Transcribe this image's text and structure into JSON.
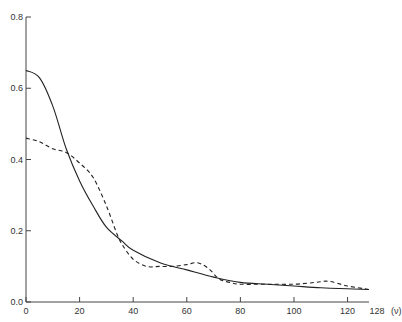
{
  "chart_data": {
    "type": "line",
    "title": "",
    "xlabel": "(ν)",
    "ylabel": "",
    "xlim": [
      0,
      128
    ],
    "ylim": [
      0,
      0.8
    ],
    "grid": false,
    "legend": null,
    "x_ticks": [
      0,
      20,
      40,
      60,
      80,
      100,
      120,
      128
    ],
    "x_tick_labels": [
      "0",
      "20",
      "40",
      "60",
      "80",
      "100",
      "120",
      "128"
    ],
    "x_unit_label": "(ν)",
    "y_ticks": [
      0.0,
      0.2,
      0.4,
      0.6,
      0.8
    ],
    "y_tick_labels": [
      "0.0",
      "0.2",
      "0.4",
      "0.6",
      "0.8"
    ],
    "series": [
      {
        "name": "solid",
        "style": "solid",
        "x": [
          0,
          5,
          10,
          15,
          20,
          25,
          30,
          36,
          40,
          50,
          60,
          70,
          80,
          90,
          100,
          110,
          120,
          128
        ],
        "values": [
          0.65,
          0.63,
          0.55,
          0.43,
          0.34,
          0.27,
          0.21,
          0.17,
          0.145,
          0.11,
          0.09,
          0.07,
          0.055,
          0.05,
          0.045,
          0.04,
          0.037,
          0.035
        ]
      },
      {
        "name": "dashed",
        "style": "dashed",
        "x": [
          0,
          5,
          10,
          15,
          20,
          25,
          30,
          34,
          36,
          40,
          45,
          50,
          55,
          60,
          64,
          68,
          72,
          76,
          80,
          90,
          100,
          108,
          113,
          120,
          128
        ],
        "values": [
          0.46,
          0.45,
          0.43,
          0.42,
          0.39,
          0.35,
          0.27,
          0.19,
          0.16,
          0.12,
          0.1,
          0.1,
          0.1,
          0.105,
          0.11,
          0.095,
          0.065,
          0.055,
          0.05,
          0.05,
          0.05,
          0.055,
          0.058,
          0.045,
          0.035
        ]
      }
    ]
  }
}
